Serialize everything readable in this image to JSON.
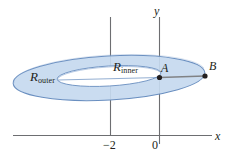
{
  "figure": {
    "labels": {
      "r_outer_base": "R",
      "r_outer_sub": "outer",
      "r_inner_base": "R",
      "r_inner_sub": "inner",
      "point_a": "A",
      "point_b": "B"
    },
    "axes": {
      "x_axis_label": "x",
      "y_axis_label": "y",
      "ticks": [
        {
          "label": "−2",
          "value": -2
        },
        {
          "label": "0",
          "value": 0
        }
      ]
    },
    "colors": {
      "annulus_fill": "#c6d9ef",
      "annulus_stroke": "#6a8fc0",
      "axis_stroke": "#6d6e71",
      "segment_stroke": "#808285",
      "point_fill": "#231f20",
      "text": "#231f20"
    }
  }
}
